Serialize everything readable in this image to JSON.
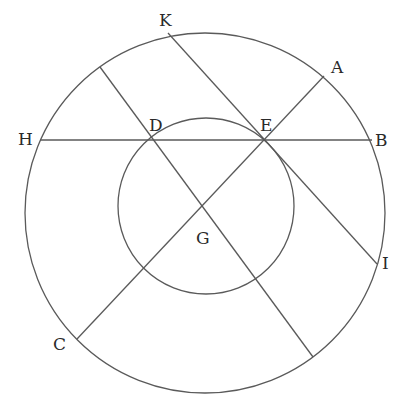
{
  "diagram": {
    "type": "geometry-construction",
    "stroke_color": "#5a5a5a",
    "label_color": "#2a2a2a",
    "background": "#ffffff",
    "circles": [
      {
        "id": "outer",
        "cx": 205,
        "cy": 213,
        "r": 180
      },
      {
        "id": "inner",
        "cx": 206,
        "cy": 206,
        "r": 88
      }
    ],
    "lines": [
      {
        "id": "HB",
        "x1": 40,
        "y1": 140,
        "x2": 372,
        "y2": 140
      },
      {
        "id": "KI",
        "x1": 168,
        "y1": 33,
        "x2": 377,
        "y2": 264
      },
      {
        "id": "AC",
        "x1": 324,
        "y1": 76,
        "x2": 77,
        "y2": 339
      },
      {
        "id": "DG-diameter",
        "x1": 100,
        "y1": 67,
        "x2": 313,
        "y2": 357
      }
    ],
    "labels": [
      {
        "text": "K",
        "x": 159,
        "y": 26
      },
      {
        "text": "A",
        "x": 331,
        "y": 73
      },
      {
        "text": "H",
        "x": 18,
        "y": 145
      },
      {
        "text": "D",
        "x": 149,
        "y": 131
      },
      {
        "text": "E",
        "x": 260,
        "y": 131
      },
      {
        "text": "B",
        "x": 375,
        "y": 146
      },
      {
        "text": "G",
        "x": 196,
        "y": 244
      },
      {
        "text": "I",
        "x": 382,
        "y": 269
      },
      {
        "text": "C",
        "x": 53,
        "y": 350
      }
    ]
  }
}
